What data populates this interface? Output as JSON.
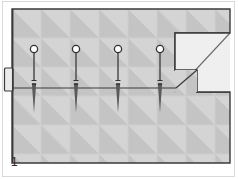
{
  "figure": {
    "number": "1",
    "caption_number": "1",
    "type": "technical-line-drawing",
    "title": ""
  },
  "canvas": {
    "width": 238,
    "height": 179,
    "background": "#ffffff"
  },
  "frame": {
    "outer_border_color": "#d9d9d9",
    "outer_border_width": 1,
    "left": 2,
    "top": 1,
    "width": 233,
    "height": 176
  },
  "body": {
    "name": "hatched-substrate",
    "fill": "#c9c9c9",
    "tile_fill_light": "#d4d4d4",
    "tile_triangle_fill": "#bdbdbd",
    "tile_size": 29,
    "outline_color": "#3a3a3a",
    "outline_width": 1.4,
    "left": 12,
    "top": 9,
    "right": 230,
    "bottom": 163
  },
  "cut_region": {
    "name": "chamfer-void",
    "fill": "#efefef",
    "description": "Light stepped wedge cut away at the upper right corner",
    "step_top_y": 33,
    "step_inner_x": 175,
    "step_mid_y": 70,
    "step_lower_x": 197,
    "step_bottom_y": 92
  },
  "ledge_line": {
    "name": "horizontal-datum-line",
    "y": 88,
    "x_start": 12,
    "x_end": 175,
    "color": "#3a3a3a",
    "width": 1.2
  },
  "left_tab": {
    "name": "left-edge-tab",
    "x": 4,
    "y": 68,
    "width": 9,
    "height": 23,
    "fill": "#eaeaea",
    "outline_color": "#3a3a3a"
  },
  "fasteners": {
    "count": 4,
    "head_radius": 3.6,
    "head_fill": "#ffffff",
    "head_outline": "#333333",
    "shaft_color": "#555555",
    "shaft_width": 1.6,
    "upper_pin_top_y": 46,
    "upper_pin_bottom_y": 80,
    "lower_nail_top_y": 84,
    "lower_nail_tip_y": 113,
    "items": [
      {
        "id": "fastener-1",
        "x": 34,
        "label": ""
      },
      {
        "id": "fastener-2",
        "x": 76,
        "label": ""
      },
      {
        "id": "fastener-3",
        "x": 118,
        "label": ""
      },
      {
        "id": "fastener-4",
        "x": 160,
        "label": ""
      }
    ]
  },
  "colors": {
    "page_background": "#ffffff",
    "substrate_light": "#d4d4d4",
    "substrate_mid": "#c9c9c9",
    "substrate_triangle": "#bdbdbd",
    "void_light": "#efefef",
    "line_dark": "#3a3a3a",
    "caption_text": "#2b2b2b"
  }
}
